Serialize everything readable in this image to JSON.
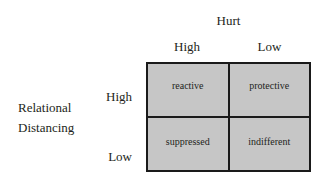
{
  "figure": {
    "type": "2x2-matrix",
    "column_axis": {
      "title": "Hurt",
      "levels": [
        "High",
        "Low"
      ]
    },
    "row_axis": {
      "title_line1": "Relational",
      "title_line2": "Distancing",
      "levels": [
        "High",
        "Low"
      ]
    },
    "cells": [
      {
        "row": "High",
        "column": "High",
        "label": "reactive"
      },
      {
        "row": "High",
        "column": "Low",
        "label": "protective"
      },
      {
        "row": "Low",
        "column": "High",
        "label": "suppressed"
      },
      {
        "row": "Low",
        "column": "Low",
        "label": "indifferent"
      }
    ],
    "colors": {
      "cell_fill": "#c6c6c6",
      "border": "#1a1a1a",
      "text": "#231f20",
      "background": "#ffffff"
    }
  }
}
